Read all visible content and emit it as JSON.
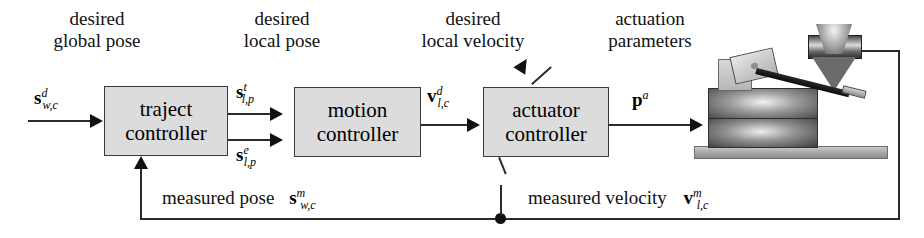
{
  "diagram": {
    "annotations": [
      {
        "name": "desired-global-pose",
        "line1": "desired",
        "line2": "global pose"
      },
      {
        "name": "desired-local-pose",
        "line1": "desired",
        "line2": "local pose"
      },
      {
        "name": "desired-local-velocity",
        "line1": "desired",
        "line2": "local velocity"
      },
      {
        "name": "actuation-parameters",
        "line1": "actuation",
        "line2": "parameters"
      }
    ],
    "blocks": [
      {
        "name": "traject-controller",
        "line1": "traject",
        "line2": "controller"
      },
      {
        "name": "motion-controller",
        "line1": "motion",
        "line2": "controller"
      },
      {
        "name": "actuator-controller",
        "line1": "actuator",
        "line2": "controller"
      }
    ],
    "signals": [
      {
        "name": "input-desired-global-pose",
        "symbol": "s",
        "sup": "d",
        "sub": "w,c"
      },
      {
        "name": "traject-out-target-pose",
        "symbol": "s",
        "sup": "t",
        "sub": "l,p"
      },
      {
        "name": "traject-out-error-pose",
        "symbol": "s",
        "sup": "e",
        "sub": "l,p"
      },
      {
        "name": "motion-out-desired-velocity",
        "symbol": "v",
        "sup": "d",
        "sub": "l,c"
      },
      {
        "name": "actuator-out-parameters",
        "symbol": "p",
        "sup": "a",
        "sub": ""
      }
    ],
    "feedback": [
      {
        "name": "measured-pose",
        "text": "measured pose",
        "symbol": "s",
        "sup": "m",
        "sub": "w,c"
      },
      {
        "name": "measured-velocity",
        "text": "measured velocity",
        "symbol": "v",
        "sup": "m",
        "sub": "l,c"
      }
    ],
    "illustration": {
      "name": "microassembly-setup",
      "parts": [
        "objective-lens",
        "positioning-stage",
        "riser-block",
        "sample-chip",
        "cantilever-probe",
        "base-plate"
      ]
    },
    "colors": {
      "block_fill": "#dcdcdc",
      "block_border": "#3a3a3a",
      "line": "#2b2b2b",
      "text": "#111111",
      "background": "#ffffff"
    }
  }
}
